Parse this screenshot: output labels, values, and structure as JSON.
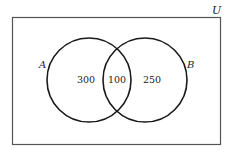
{
  "diagram": {
    "type": "venn",
    "universe_label": "U",
    "sets": [
      {
        "label": "A",
        "only_value": "300"
      },
      {
        "label": "B",
        "only_value": "250"
      }
    ],
    "intersection_value": "100"
  },
  "colors": {
    "stroke": "#1a1a1a",
    "universe_stroke": "#555555",
    "text": "#222222"
  }
}
